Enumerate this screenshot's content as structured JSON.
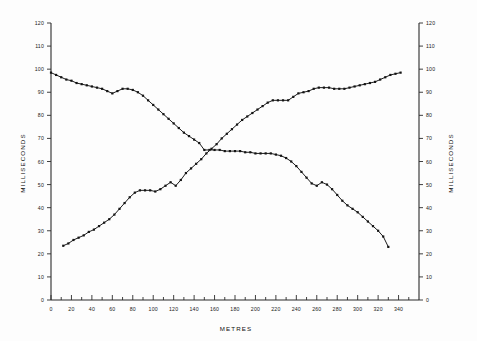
{
  "chart_data": {
    "type": "line",
    "title": "",
    "xlabel": "METRES",
    "ylabel": "MILLISECONDS",
    "ylabel_right": "MILLISECONDS",
    "xlim": [
      0,
      360
    ],
    "ylim": [
      0,
      120
    ],
    "grid": false,
    "legend": "none",
    "xticks": [
      0,
      20,
      40,
      60,
      80,
      100,
      120,
      140,
      160,
      180,
      200,
      220,
      240,
      260,
      280,
      300,
      320,
      340
    ],
    "xtick_labels": [
      "0",
      "20",
      "40",
      "60",
      "80",
      "100",
      "120",
      "140",
      "160",
      "180",
      "200",
      "220",
      "240",
      "260",
      "280",
      "300",
      "320",
      "340"
    ],
    "xminor_step": 10,
    "yticks": [
      0,
      10,
      20,
      30,
      40,
      50,
      60,
      70,
      80,
      90,
      100,
      110,
      120
    ],
    "ytick_labels": [
      "0",
      "10",
      "20",
      "30",
      "40",
      "50",
      "60",
      "70",
      "80",
      "90",
      "100",
      "110",
      "120"
    ],
    "ytick_labels_right": [
      "0",
      "10",
      "20",
      "30",
      "40",
      "50",
      "60",
      "70",
      "80",
      "90",
      "100",
      "110",
      "120"
    ],
    "marker": "square",
    "series": [
      {
        "name": "descending-curve",
        "x": [
          0,
          5,
          10,
          15,
          20,
          25,
          30,
          35,
          40,
          45,
          50,
          55,
          60,
          65,
          70,
          75,
          80,
          85,
          90,
          95,
          100,
          105,
          110,
          115,
          120,
          125,
          130,
          135,
          140,
          145,
          150,
          155,
          160,
          165,
          170,
          175,
          180,
          185,
          190,
          195,
          200,
          205,
          210,
          215,
          220,
          225,
          230,
          235,
          240,
          245,
          250,
          255,
          260,
          265,
          270,
          275,
          280,
          285,
          290,
          295,
          300,
          305,
          310,
          315,
          320,
          325,
          330
        ],
        "y": [
          98.5,
          97.5,
          96.5,
          95.5,
          95.0,
          94.0,
          93.5,
          93.0,
          92.5,
          92.0,
          91.5,
          90.5,
          89.5,
          90.5,
          91.5,
          91.5,
          91.0,
          90.0,
          88.5,
          86.5,
          84.5,
          82.5,
          80.5,
          78.5,
          76.5,
          74.5,
          72.5,
          71.0,
          69.5,
          68.0,
          65.0,
          65.0,
          65.0,
          65.0,
          64.5,
          64.5,
          64.5,
          64.5,
          64.0,
          64.0,
          63.5,
          63.5,
          63.5,
          63.5,
          63.0,
          62.5,
          61.5,
          60.0,
          58.0,
          55.5,
          53.0,
          50.5,
          49.5,
          51.0,
          50.0,
          48.0,
          45.5,
          43.0,
          41.0,
          39.5,
          38.0,
          36.0,
          34.0,
          32.0,
          30.0,
          27.5,
          23.0
        ]
      },
      {
        "name": "ascending-curve",
        "x": [
          12,
          17,
          22,
          27,
          32,
          37,
          42,
          47,
          52,
          57,
          62,
          67,
          72,
          77,
          82,
          87,
          92,
          97,
          102,
          107,
          112,
          117,
          122,
          127,
          132,
          137,
          142,
          147,
          152,
          157,
          162,
          167,
          172,
          177,
          182,
          187,
          192,
          197,
          202,
          207,
          212,
          217,
          222,
          227,
          232,
          237,
          242,
          247,
          252,
          257,
          262,
          267,
          272,
          277,
          282,
          287,
          292,
          297,
          302,
          307,
          312,
          317,
          322,
          327,
          332,
          337,
          342
        ],
        "y": [
          23.5,
          24.5,
          26.0,
          27.0,
          28.0,
          29.5,
          30.5,
          32.0,
          33.5,
          35.0,
          37.0,
          39.5,
          42.0,
          44.5,
          46.5,
          47.5,
          47.5,
          47.5,
          47.0,
          48.0,
          49.5,
          51.0,
          49.5,
          52.0,
          55.0,
          57.0,
          59.0,
          61.0,
          63.5,
          65.5,
          67.5,
          70.0,
          72.0,
          74.0,
          76.0,
          78.0,
          79.5,
          81.0,
          82.5,
          84.0,
          85.5,
          86.5,
          86.5,
          86.5,
          86.5,
          88.0,
          89.5,
          90.0,
          90.5,
          91.5,
          92.0,
          92.0,
          92.0,
          91.5,
          91.5,
          91.5,
          92.0,
          92.5,
          93.0,
          93.5,
          94.0,
          94.5,
          95.5,
          96.5,
          97.5,
          98.0,
          98.5
        ]
      }
    ]
  }
}
